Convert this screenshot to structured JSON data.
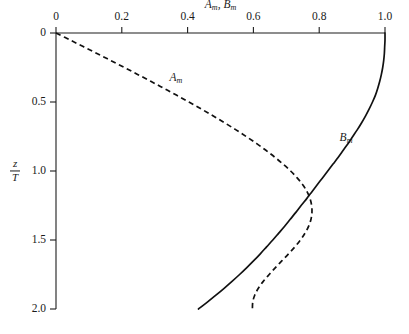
{
  "figure": {
    "background_color": "#ffffff",
    "ink_color": "#111111"
  },
  "chart_data": {
    "type": "line",
    "title": "",
    "xlabel": "A_m, B_m",
    "xlabel_parts": {
      "first_symbol": "A",
      "first_sub": "m",
      "separator": ",",
      "second_symbol": "B",
      "second_sub": "m"
    },
    "ylabel": "z/T",
    "ylabel_parts": {
      "numerator": "z",
      "denominator": "T"
    },
    "xlim": [
      0,
      1.0
    ],
    "ylim": [
      0,
      2.0
    ],
    "y_inverted": true,
    "x_axis_position": "top",
    "y_axis_position": "left",
    "grid": false,
    "legend": "inline-curve-labels",
    "xticks": [
      0,
      0.2,
      0.4,
      0.6,
      0.8,
      1.0
    ],
    "xticklabels": [
      "0",
      "0.2",
      "0.4",
      "0.6",
      "0.8",
      "1.0"
    ],
    "yticks": [
      0,
      0.5,
      1.0,
      1.5,
      2.0
    ],
    "yticklabels": [
      "0",
      "0.5",
      "1.0",
      "1.5",
      "2.0"
    ],
    "series": [
      {
        "name": "A_m",
        "label": "A",
        "label_sub": "m",
        "style": "dashed",
        "label_x": 0.345,
        "label_y": 0.285,
        "points": [
          [
            0.0,
            0.0
          ],
          [
            0.042,
            0.05
          ],
          [
            0.084,
            0.1
          ],
          [
            0.126,
            0.15
          ],
          [
            0.167,
            0.2
          ],
          [
            0.208,
            0.25
          ],
          [
            0.248,
            0.3
          ],
          [
            0.288,
            0.35
          ],
          [
            0.327,
            0.4
          ],
          [
            0.366,
            0.45
          ],
          [
            0.404,
            0.5
          ],
          [
            0.441,
            0.55
          ],
          [
            0.477,
            0.6
          ],
          [
            0.512,
            0.65
          ],
          [
            0.546,
            0.7
          ],
          [
            0.578,
            0.75
          ],
          [
            0.609,
            0.8
          ],
          [
            0.638,
            0.85
          ],
          [
            0.665,
            0.9
          ],
          [
            0.69,
            0.95
          ],
          [
            0.713,
            1.0
          ],
          [
            0.733,
            1.05
          ],
          [
            0.75,
            1.1
          ],
          [
            0.763,
            1.15
          ],
          [
            0.772,
            1.2
          ],
          [
            0.777,
            1.25
          ],
          [
            0.778,
            1.3
          ],
          [
            0.775,
            1.35
          ],
          [
            0.768,
            1.4
          ],
          [
            0.757,
            1.45
          ],
          [
            0.743,
            1.5
          ],
          [
            0.726,
            1.55
          ],
          [
            0.707,
            1.6
          ],
          [
            0.687,
            1.65
          ],
          [
            0.667,
            1.7
          ],
          [
            0.648,
            1.75
          ],
          [
            0.63,
            1.8
          ],
          [
            0.615,
            1.85
          ],
          [
            0.604,
            1.9
          ],
          [
            0.598,
            1.95
          ],
          [
            0.597,
            2.0
          ]
        ]
      },
      {
        "name": "B_m",
        "label": "B",
        "label_sub": "m",
        "style": "solid",
        "label_x": 0.862,
        "label_y": 0.716,
        "points": [
          [
            1.0,
            0.0
          ],
          [
            1.0,
            0.05
          ],
          [
            0.999,
            0.1
          ],
          [
            0.998,
            0.15
          ],
          [
            0.996,
            0.2
          ],
          [
            0.993,
            0.25
          ],
          [
            0.989,
            0.3
          ],
          [
            0.984,
            0.35
          ],
          [
            0.978,
            0.4
          ],
          [
            0.971,
            0.45
          ],
          [
            0.962,
            0.5
          ],
          [
            0.952,
            0.55
          ],
          [
            0.941,
            0.6
          ],
          [
            0.929,
            0.65
          ],
          [
            0.916,
            0.7
          ],
          [
            0.902,
            0.75
          ],
          [
            0.888,
            0.8
          ],
          [
            0.873,
            0.85
          ],
          [
            0.858,
            0.9
          ],
          [
            0.842,
            0.95
          ],
          [
            0.826,
            1.0
          ],
          [
            0.81,
            1.05
          ],
          [
            0.794,
            1.1
          ],
          [
            0.778,
            1.15
          ],
          [
            0.762,
            1.2
          ],
          [
            0.745,
            1.25
          ],
          [
            0.729,
            1.3
          ],
          [
            0.712,
            1.35
          ],
          [
            0.695,
            1.4
          ],
          [
            0.677,
            1.45
          ],
          [
            0.659,
            1.5
          ],
          [
            0.64,
            1.55
          ],
          [
            0.621,
            1.6
          ],
          [
            0.601,
            1.65
          ],
          [
            0.58,
            1.7
          ],
          [
            0.558,
            1.75
          ],
          [
            0.535,
            1.8
          ],
          [
            0.511,
            1.85
          ],
          [
            0.486,
            1.9
          ],
          [
            0.46,
            1.95
          ],
          [
            0.433,
            2.0
          ]
        ]
      }
    ],
    "annotations": [
      {
        "text": "curves cross near A_m = B_m = 0.78 at z/T = 1.18"
      }
    ]
  },
  "axes": {
    "x_tick_labels": [
      "0",
      "0.2",
      "0.4",
      "0.6",
      "0.8",
      "1.0"
    ],
    "y_tick_labels": [
      "0",
      "0.5",
      "1.0",
      "1.5",
      "2.0"
    ]
  }
}
